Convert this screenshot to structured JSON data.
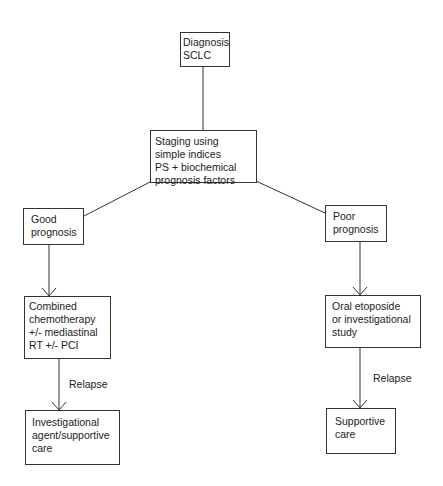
{
  "diagram": {
    "nodes": {
      "diagnosis": "Diagnosis\nSCLC",
      "staging": "Staging using\nsimple indices\nPS + biochemical\nprognosis factors",
      "good": "Good\nprognosis",
      "poor": "Poor\nprognosis",
      "combined": "Combined\nchemotherapy\n+/- mediastinal\nRT  +/- PCI",
      "oral": "Oral etoposide\nor investigational\nstudy",
      "investigational": "Investigational\nagent/supportive\ncare",
      "supportive": "Supportive\ncare"
    },
    "edge_labels": {
      "relapse_left": "Relapse",
      "relapse_right": "Relapse"
    },
    "edges": [
      {
        "from": "diagnosis",
        "to": "staging",
        "arrow": false
      },
      {
        "from": "staging",
        "to": "good",
        "arrow": false
      },
      {
        "from": "staging",
        "to": "poor",
        "arrow": false
      },
      {
        "from": "good",
        "to": "combined",
        "arrow": true
      },
      {
        "from": "poor",
        "to": "oral",
        "arrow": true
      },
      {
        "from": "combined",
        "to": "investigational",
        "arrow": true,
        "label": "Relapse"
      },
      {
        "from": "oral",
        "to": "supportive",
        "arrow": true,
        "label": "Relapse"
      }
    ]
  }
}
